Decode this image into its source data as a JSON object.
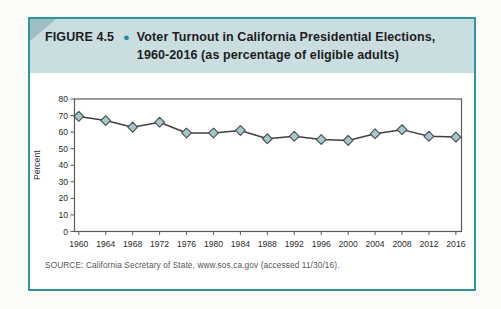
{
  "figure": {
    "header": {
      "figure_label": "FIGURE 4.5",
      "bullet": "●",
      "title_line1": "Voter Turnout in California Presidential Elections,",
      "title_line2": "1960-2016 (as percentage of eligible adults)",
      "background": "#cadee2",
      "corner_color": "#9dbec4",
      "bullet_color": "#1f8fa0"
    },
    "border_color": "#2e96a1",
    "source_text": "SOURCE: California Secretary of State, www.sos.ca.gov (accessed 11/30/16)."
  },
  "chart_data": {
    "type": "line",
    "title": "Voter Turnout in California Presidential Elections, 1960-2016",
    "xlabel": "",
    "ylabel": "Percent",
    "ylim": [
      0,
      80
    ],
    "ytick_interval": 10,
    "yticks": [
      0,
      10,
      20,
      30,
      40,
      50,
      60,
      70,
      80
    ],
    "categories": [
      "1960",
      "1964",
      "1968",
      "1972",
      "1976",
      "1980",
      "1984",
      "1988",
      "1992",
      "1996",
      "2000",
      "2004",
      "2008",
      "2012",
      "2016"
    ],
    "series": [
      {
        "name": "Voter turnout (% of eligible adults)",
        "values": [
          69.5,
          67,
          63,
          66,
          59.5,
          59.5,
          61,
          56,
          57.5,
          55.5,
          55,
          59,
          61.5,
          57.5,
          57
        ]
      }
    ],
    "grid": false,
    "legend": false,
    "marker": "diamond",
    "colors": {
      "line": "#414042",
      "marker_fill": "#a2c9cd",
      "marker_stroke": "#4a4a4c",
      "plot_border": "#58595b",
      "tick_text": "#2a2a28"
    }
  }
}
